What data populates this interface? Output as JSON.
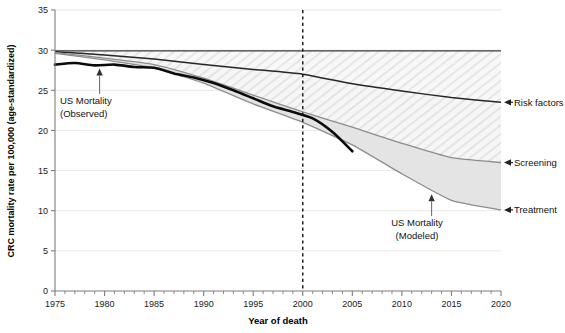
{
  "chart_data": {
    "type": "area",
    "title": "",
    "xlabel": "Year of death",
    "ylabel": "CRC mortality rate per 100,000 (age-standardized)",
    "xlim": [
      1975,
      2020
    ],
    "ylim": [
      0,
      35
    ],
    "xticks": [
      1975,
      1980,
      1985,
      1990,
      1995,
      2000,
      2005,
      2010,
      2015,
      2020
    ],
    "yticks": [
      0,
      5,
      10,
      15,
      20,
      25,
      30,
      35
    ],
    "xtick_labels": [
      "1975",
      "1980",
      "1985",
      "1990",
      "1995",
      "2000",
      "2005",
      "2010",
      "2015",
      "2020"
    ],
    "ytick_labels": [
      "0",
      "5",
      "10",
      "15",
      "20",
      "25",
      "30",
      "35"
    ],
    "minor_x_interval": 1,
    "grid": "light-horizontal",
    "legend_position": "right-outside-arrows",
    "vertical_reference_line": {
      "x": 2000,
      "style": "dashed",
      "label": ""
    },
    "series": [
      {
        "name": "No-intervention baseline (top of stacked bands)",
        "style": "dark-thin-line",
        "x": [
          1975,
          1980,
          1985,
          1990,
          1995,
          2000,
          2005,
          2010,
          2015,
          2020
        ],
        "values": [
          29.9,
          29.9,
          29.9,
          29.9,
          29.9,
          29.9,
          29.9,
          29.9,
          29.9,
          29.9
        ]
      },
      {
        "name": "Risk factors (lower edge)",
        "style": "dark-line",
        "x": [
          1975,
          1980,
          1985,
          1990,
          1995,
          2000,
          2005,
          2010,
          2015,
          2020
        ],
        "values": [
          29.8,
          29.4,
          28.9,
          28.2,
          27.6,
          27.0,
          25.8,
          24.9,
          24.1,
          23.5
        ]
      },
      {
        "name": "Screening (lower edge)",
        "style": "grey-line",
        "x": [
          1975,
          1980,
          1985,
          1990,
          1995,
          2000,
          2005,
          2010,
          2015,
          2020
        ],
        "values": [
          29.7,
          29.0,
          28.2,
          26.5,
          24.4,
          22.3,
          20.4,
          18.4,
          16.6,
          16.0
        ]
      },
      {
        "name": "Treatment (lower edge) = US Mortality (Modeled)",
        "style": "grey-line",
        "x": [
          1975,
          1980,
          1985,
          1990,
          1995,
          2000,
          2005,
          2010,
          2015,
          2020
        ],
        "values": [
          29.6,
          28.8,
          27.8,
          25.9,
          23.3,
          21.0,
          18.2,
          14.6,
          11.3,
          10.1
        ]
      },
      {
        "name": "US Mortality (Observed)",
        "style": "thick-black-line",
        "x": [
          1975,
          1977,
          1979,
          1981,
          1983,
          1985,
          1987,
          1989,
          1991,
          1993,
          1995,
          1997,
          1999,
          2001,
          2003,
          2005
        ],
        "values": [
          28.2,
          28.4,
          28.1,
          28.2,
          27.9,
          27.8,
          27.1,
          26.6,
          25.9,
          25.0,
          24.0,
          23.0,
          22.3,
          21.5,
          19.8,
          17.4
        ]
      }
    ],
    "bands": [
      {
        "name": "Risk factors",
        "upper_series": 0,
        "lower_series": 1
      },
      {
        "name": "Screening",
        "upper_series": 1,
        "lower_series": 2
      },
      {
        "name": "Treatment",
        "upper_series": 2,
        "lower_series": 3
      }
    ],
    "annotations": [
      {
        "name": "us-mortality-observed",
        "text_line1": "US Mortality",
        "text_line2": "(Observed)",
        "points_to_x": 1979.5,
        "points_to_y": 28.1
      },
      {
        "name": "us-mortality-modeled",
        "text_line1": "US Mortality",
        "text_line2": "(Modeled)",
        "points_to_x": 2013,
        "points_to_y": 12.3
      }
    ],
    "side_labels": [
      {
        "name": "risk-factors",
        "text": "Risk factors",
        "y_value": 23.5
      },
      {
        "name": "screening",
        "text": "Screening",
        "y_value": 16.0
      },
      {
        "name": "treatment",
        "text": "Treatment",
        "y_value": 10.1
      }
    ]
  },
  "axes": {
    "y_title": "CRC mortality rate per 100,000 (age-standardized)",
    "x_title": "Year of death"
  },
  "colors": {
    "observed_line": "#0b0b0b",
    "band_edge_dark": "#262626",
    "band_edge_grey": "#8d8d8d",
    "risk_band_fill": "#f0f0f0",
    "screening_band_fill": "#ebebeb",
    "treatment_band_fill": "#e2e2e2",
    "axis": "#7d7d7d",
    "text": "#111111"
  }
}
